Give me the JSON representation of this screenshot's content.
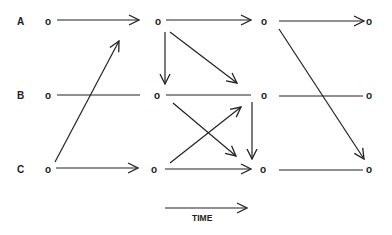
{
  "diagram": {
    "type": "network-over-time",
    "rows": [
      {
        "id": "A",
        "label": "A",
        "y": 21
      },
      {
        "id": "B",
        "label": "B",
        "y": 95
      },
      {
        "id": "C",
        "label": "C",
        "y": 169
      }
    ],
    "node_glyph": "o",
    "time_axis": {
      "label": "TIME",
      "direction": "right"
    },
    "nodes": [
      {
        "id": "A0",
        "row": "A",
        "col": 0
      },
      {
        "id": "A1",
        "row": "A",
        "col": 1
      },
      {
        "id": "A2",
        "row": "A",
        "col": 2
      },
      {
        "id": "A3",
        "row": "A",
        "col": 3
      },
      {
        "id": "B0",
        "row": "B",
        "col": 0
      },
      {
        "id": "B1",
        "row": "B",
        "col": 1
      },
      {
        "id": "B2",
        "row": "B",
        "col": 2
      },
      {
        "id": "B3",
        "row": "B",
        "col": 3
      },
      {
        "id": "C0",
        "row": "C",
        "col": 0
      },
      {
        "id": "C1",
        "row": "C",
        "col": 1
      },
      {
        "id": "C2",
        "row": "C",
        "col": 2
      },
      {
        "id": "C3",
        "row": "C",
        "col": 3
      }
    ],
    "edges": [
      {
        "from": "A0",
        "to": "A1",
        "arrow": true
      },
      {
        "from": "A1",
        "to": "A2",
        "arrow": true
      },
      {
        "from": "A2",
        "to": "A3",
        "arrow": true
      },
      {
        "from": "B0",
        "to": "B1",
        "arrow": false
      },
      {
        "from": "B1",
        "to": "B2",
        "arrow": false
      },
      {
        "from": "B2",
        "to": "B3",
        "arrow": false
      },
      {
        "from": "C0",
        "to": "C1",
        "arrow": true
      },
      {
        "from": "C1",
        "to": "C2",
        "arrow": true
      },
      {
        "from": "C2",
        "to": "C3",
        "arrow": false
      },
      {
        "from": "C0",
        "to": "A1",
        "arrow": true
      },
      {
        "from": "A1",
        "to": "B1",
        "arrow": true
      },
      {
        "from": "A1",
        "to": "B2",
        "arrow": true
      },
      {
        "from": "B1",
        "to": "C2",
        "arrow": true
      },
      {
        "from": "C1",
        "to": "B2",
        "arrow": true
      },
      {
        "from": "B2",
        "to": "C2",
        "arrow": true
      },
      {
        "from": "A2",
        "to": "C3",
        "arrow": true
      }
    ]
  }
}
